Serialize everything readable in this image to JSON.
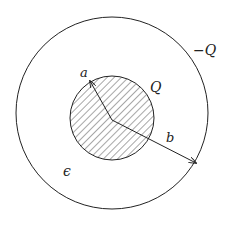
{
  "diagram": {
    "type": "coaxial-sphere-capacitor",
    "colors": {
      "stroke": "#222222",
      "background": "#ffffff"
    },
    "outer_circle": {
      "cx": 112,
      "cy": 113,
      "r": 96
    },
    "inner_circle": {
      "cx": 112,
      "cy": 118,
      "r": 42,
      "fill": "hatched"
    },
    "arrows": [
      {
        "name": "radius-a",
        "from": [
          112,
          120
        ],
        "to": [
          90,
          80
        ]
      },
      {
        "name": "radius-b",
        "from": [
          112,
          120
        ],
        "to": [
          196,
          163
        ]
      }
    ],
    "labels": {
      "a": "a",
      "Q": "Q",
      "minus_Q": "−Q",
      "b": "b",
      "epsilon": "ϵ"
    }
  }
}
